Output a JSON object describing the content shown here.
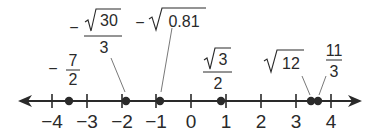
{
  "number_line": {
    "min_tick": -4,
    "max_tick": 4,
    "ticks": [
      "−4",
      "−3",
      "−2",
      "−1",
      "0",
      "1",
      "2",
      "3",
      "4"
    ],
    "color": "#2a2a2a"
  },
  "points": [
    {
      "id": "neg_seven_halves",
      "sign": "−",
      "numerator": "7",
      "denominator": "2",
      "value": -3.5
    },
    {
      "id": "neg_sqrt30_over_3",
      "sign": "−",
      "radicand": "30",
      "denominator": "3",
      "value": -1.826
    },
    {
      "id": "neg_sqrt_081",
      "sign": "−",
      "radicand": "0.81",
      "value": -0.9
    },
    {
      "id": "sqrt3_over_2",
      "radicand": "3",
      "denominator": "2",
      "value": 0.866
    },
    {
      "id": "sqrt12",
      "radicand": "12",
      "value": 3.464
    },
    {
      "id": "eleven_thirds",
      "numerator": "11",
      "denominator": "3",
      "value": 3.667
    }
  ]
}
